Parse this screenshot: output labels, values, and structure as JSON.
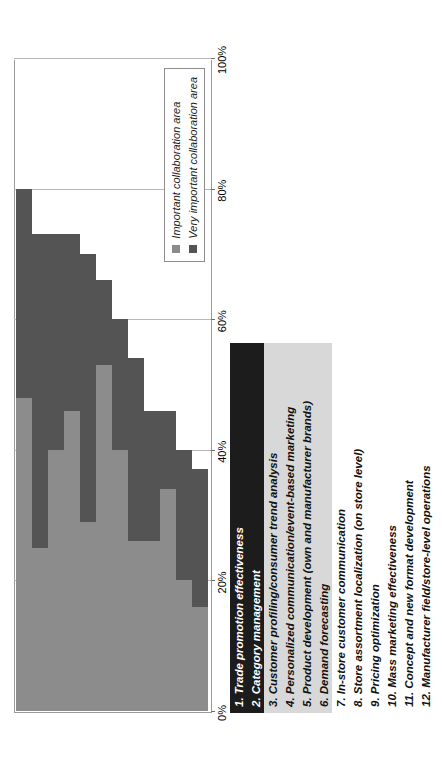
{
  "chart_data": {
    "type": "bar",
    "orientation": "vertical-rotated",
    "stacked": true,
    "title": "",
    "xlabel": "",
    "ylabel": "",
    "ylim": [
      0,
      100
    ],
    "grid": true,
    "legend_position": "inside-upper-right",
    "axis_ticks": [
      "0%",
      "20%",
      "40%",
      "60%",
      "80%",
      "100%"
    ],
    "axis_tick_values": [
      0,
      20,
      40,
      60,
      80,
      100
    ],
    "categories": [
      "1. Trade promotion effectiveness",
      "2. Category management",
      "3. Customer profiling/consumer trend analysis",
      "4. Personalized communication/event-based marketing",
      "5. Product development (own and manufacturer brands)",
      "6. Demand forecasting",
      "7. In-store customer communication",
      "8. Store assortment localization (on store level)",
      "9. Pricing optimization",
      "10. Mass marketing effectiveness",
      "11. Concept and new format development",
      "12. Manufacturer field/store-level operations"
    ],
    "series": [
      {
        "name": "Important collaboration area",
        "color": "#8c8c8c",
        "values": [
          48,
          25,
          40,
          46,
          29,
          53,
          40,
          26,
          26,
          34,
          20,
          16
        ]
      },
      {
        "name": "Very important collaboration area",
        "color": "#545454",
        "values": [
          32,
          48,
          33,
          27,
          41,
          13,
          20,
          28,
          20,
          12,
          20,
          21
        ]
      }
    ],
    "totals": [
      80,
      73,
      73,
      73,
      70,
      66,
      60,
      54,
      46,
      46,
      40,
      37
    ]
  },
  "legend": {
    "items": [
      {
        "label": "Important collaboration area",
        "swatch": "important"
      },
      {
        "label": "Very important collaboration area",
        "swatch": "very"
      }
    ]
  },
  "category_highlight": [
    "dark",
    "dark",
    "light",
    "light",
    "light",
    "light",
    "none",
    "none",
    "none",
    "none",
    "none",
    "none"
  ],
  "colors": {
    "important": "#8c8c8c",
    "very_important": "#545454",
    "highlight_dark": "#1c1c1c",
    "highlight_light": "#d8d8d8",
    "gridline": "#b8b8b8",
    "axis": "#9a9a9a"
  }
}
